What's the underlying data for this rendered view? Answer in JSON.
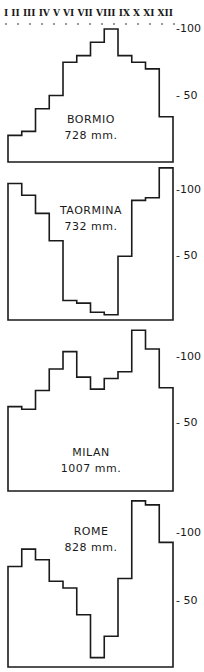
{
  "chart_data": [
    {
      "type": "bar",
      "style": "step-histogram",
      "title": "BORMIO",
      "subtitle": "728 mm.",
      "categories": [
        "I",
        "II",
        "III",
        "IV",
        "V",
        "VI",
        "VII",
        "VIII",
        "IX",
        "X",
        "XI",
        "XII"
      ],
      "values": [
        20,
        23,
        40,
        50,
        75,
        80,
        90,
        100,
        80,
        75,
        70,
        34
      ],
      "ylabel": "",
      "xlabel": "",
      "yticks": [
        50,
        100
      ],
      "ylim": [
        0,
        105
      ]
    },
    {
      "type": "bar",
      "style": "step-histogram",
      "title": "TAORMINA",
      "subtitle": "732 mm.",
      "categories": [
        "I",
        "II",
        "III",
        "IV",
        "V",
        "VI",
        "VII",
        "VIII",
        "IX",
        "X",
        "XI",
        "XII"
      ],
      "values": [
        105,
        96,
        82,
        61,
        15,
        13,
        6,
        4,
        49,
        92,
        94,
        117
      ],
      "yticks": [
        50,
        100
      ],
      "ylim": [
        0,
        120
      ]
    },
    {
      "type": "bar",
      "style": "step-histogram",
      "title": "MILAN",
      "subtitle": "1007 mm.",
      "categories": [
        "I",
        "II",
        "III",
        "IV",
        "V",
        "VI",
        "VII",
        "VIII",
        "IX",
        "X",
        "XI",
        "XII"
      ],
      "values": [
        63,
        61,
        75,
        91,
        104,
        85,
        76,
        84,
        89,
        120,
        106,
        77
      ],
      "yticks": [
        50,
        100
      ],
      "ylim": [
        0,
        125
      ]
    },
    {
      "type": "bar",
      "style": "step-histogram",
      "title": "ROME",
      "subtitle": "828 mm.",
      "categories": [
        "I",
        "II",
        "III",
        "IV",
        "V",
        "VI",
        "VII",
        "VIII",
        "IX",
        "X",
        "XI",
        "XII"
      ],
      "values": [
        75,
        88,
        80,
        64,
        59,
        39,
        7,
        23,
        66,
        124,
        121,
        93
      ],
      "yticks": [
        50,
        100
      ],
      "ylim": [
        0,
        125
      ]
    }
  ],
  "months_label": "I II III IV V VI VII VIII IX X XI XII",
  "ticks": {
    "t100": "-100",
    "t50": "- 50"
  }
}
